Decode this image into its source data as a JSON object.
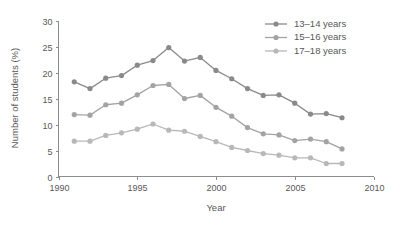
{
  "chart_data": {
    "type": "line",
    "title": "",
    "xlabel": "Year",
    "ylabel": "Number of students (%)",
    "xlim": [
      1990,
      2010
    ],
    "ylim": [
      0,
      30
    ],
    "xticks": [
      1990,
      1995,
      2000,
      2005,
      2010
    ],
    "yticks": [
      0,
      5,
      10,
      15,
      20,
      25,
      30
    ],
    "grid": false,
    "legend_position": "top-right",
    "x": [
      1991,
      1992,
      1993,
      1994,
      1995,
      1996,
      1997,
      1998,
      1999,
      2000,
      2001,
      2002,
      2003,
      2004,
      2005,
      2006,
      2007,
      2008
    ],
    "series": [
      {
        "name": "13–14 years",
        "color": "#8a8a8c",
        "values": [
          18.2,
          16.9,
          18.9,
          19.4,
          21.4,
          22.3,
          24.8,
          22.2,
          22.9,
          20.4,
          18.8,
          16.9,
          15.6,
          15.7,
          14.1,
          12.0,
          12.1,
          11.3
        ]
      },
      {
        "name": "15–16 years",
        "color": "#a3a3a5",
        "values": [
          11.9,
          11.8,
          13.8,
          14.1,
          15.7,
          17.5,
          17.7,
          15.0,
          15.6,
          13.3,
          11.6,
          9.4,
          8.2,
          8.0,
          6.9,
          7.2,
          6.7,
          5.3
        ]
      },
      {
        "name": "17–18 years",
        "color": "#b8b8ba",
        "values": [
          6.8,
          6.8,
          7.9,
          8.4,
          9.1,
          10.1,
          8.9,
          8.7,
          7.7,
          6.7,
          5.6,
          5.0,
          4.4,
          4.1,
          3.6,
          3.6,
          2.5,
          2.5
        ]
      }
    ]
  },
  "legend": {
    "items": [
      {
        "label": "13–14 years"
      },
      {
        "label": "15–16 years"
      },
      {
        "label": "17–18 years"
      }
    ]
  },
  "axes": {
    "y_title": "Number of students (%)",
    "x_title": "Year",
    "y_tick_labels": [
      "0",
      "5",
      "10",
      "15",
      "20",
      "25",
      "30"
    ],
    "x_tick_labels": [
      "1990",
      "1995",
      "2000",
      "2005",
      "2010"
    ]
  },
  "colors": {
    "axis": "#8c8c8e",
    "text": "#58585a",
    "background": "#ffffff",
    "series1": "#8a8a8c",
    "series2": "#a3a3a5",
    "series3": "#b8b8ba"
  }
}
